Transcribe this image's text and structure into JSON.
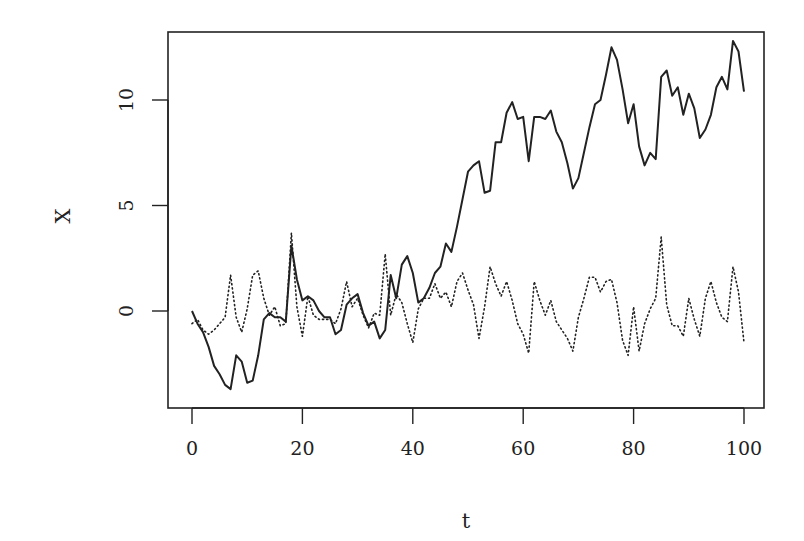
{
  "chart_data": {
    "type": "line",
    "title": "",
    "xlabel": "t",
    "ylabel": "X",
    "xlim": [
      0,
      100
    ],
    "ylim": [
      -4.5,
      13.5
    ],
    "xticks": [
      0,
      20,
      40,
      60,
      80,
      100
    ],
    "yticks": [
      0,
      5,
      10
    ],
    "grid": false,
    "legend": null,
    "series": [
      {
        "name": "random walk",
        "style": "solid",
        "x": [
          0,
          1,
          2,
          3,
          4,
          5,
          6,
          7,
          8,
          9,
          10,
          11,
          12,
          13,
          14,
          15,
          16,
          17,
          18,
          19,
          20,
          21,
          22,
          23,
          24,
          25,
          26,
          27,
          28,
          29,
          30,
          31,
          32,
          33,
          34,
          35,
          36,
          37,
          38,
          39,
          40,
          41,
          42,
          43,
          44,
          45,
          46,
          47,
          48,
          49,
          50,
          51,
          52,
          53,
          54,
          55,
          56,
          57,
          58,
          59,
          60,
          61,
          62,
          63,
          64,
          65,
          66,
          67,
          68,
          69,
          70,
          71,
          72,
          73,
          74,
          75,
          76,
          77,
          78,
          79,
          80,
          81,
          82,
          83,
          84,
          85,
          86,
          87,
          88,
          89,
          90,
          91,
          92,
          93,
          94,
          95,
          96,
          97,
          98,
          99,
          100
        ],
        "values": [
          0,
          -0.6,
          -1.0,
          -1.7,
          -2.6,
          -3.0,
          -3.5,
          -3.7,
          -2.1,
          -2.4,
          -3.4,
          -3.3,
          -2.1,
          -0.4,
          -0.1,
          -0.3,
          -0.3,
          -0.5,
          3.1,
          1.5,
          0.5,
          0.7,
          0.5,
          0.0,
          -0.3,
          -0.3,
          -1.1,
          -0.9,
          0.3,
          0.6,
          0.8,
          -0.1,
          -0.7,
          -0.5,
          -1.3,
          -0.9,
          1.7,
          0.6,
          2.2,
          2.6,
          1.8,
          0.4,
          0.6,
          1.1,
          1.8,
          2.1,
          3.2,
          2.8,
          4.0,
          5.3,
          6.6,
          6.9,
          7.1,
          5.6,
          5.7,
          8.0,
          8.0,
          9.4,
          9.9,
          9.1,
          9.2,
          7.1,
          9.2,
          9.2,
          9.1,
          9.5,
          8.5,
          8.0,
          7.0,
          5.8,
          6.3,
          7.5,
          8.7,
          9.8,
          10.0,
          11.2,
          12.5,
          11.9,
          10.5,
          8.9,
          9.8,
          7.8,
          6.9,
          7.5,
          7.2,
          11.1,
          11.4,
          10.2,
          10.6,
          9.3,
          10.3,
          9.6,
          8.2,
          8.6,
          9.3,
          10.6,
          11.1,
          10.5,
          12.8,
          12.3,
          10.4
        ]
      },
      {
        "name": "white noise",
        "style": "dotted",
        "x": [
          0,
          1,
          2,
          3,
          4,
          5,
          6,
          7,
          8,
          9,
          10,
          11,
          12,
          13,
          14,
          15,
          16,
          17,
          18,
          19,
          20,
          21,
          22,
          23,
          24,
          25,
          26,
          27,
          28,
          29,
          30,
          31,
          32,
          33,
          34,
          35,
          36,
          37,
          38,
          39,
          40,
          41,
          42,
          43,
          44,
          45,
          46,
          47,
          48,
          49,
          50,
          51,
          52,
          53,
          54,
          55,
          56,
          57,
          58,
          59,
          60,
          61,
          62,
          63,
          64,
          65,
          66,
          67,
          68,
          69,
          70,
          71,
          72,
          73,
          74,
          75,
          76,
          77,
          78,
          79,
          80,
          81,
          82,
          83,
          84,
          85,
          86,
          87,
          88,
          89,
          90,
          91,
          92,
          93,
          94,
          95,
          96,
          97,
          98,
          99,
          100
        ],
        "values": [
          -0.6,
          -0.4,
          -0.9,
          -1.1,
          -0.9,
          -0.6,
          -0.3,
          1.7,
          -0.3,
          -1.0,
          0.1,
          1.7,
          1.9,
          0.6,
          -0.2,
          0.2,
          -0.7,
          -0.6,
          3.7,
          0.2,
          -1.2,
          0.7,
          -0.2,
          -0.4,
          -0.4,
          -0.4,
          -0.6,
          0.1,
          1.4,
          0.2,
          0.6,
          -0.2,
          -0.8,
          -0.1,
          -0.2,
          2.7,
          -0.2,
          0.8,
          0.4,
          -0.6,
          -1.5,
          0.1,
          0.6,
          0.6,
          1.3,
          0.6,
          0.9,
          0.2,
          1.4,
          1.8,
          1.0,
          0.3,
          -1.3,
          0.2,
          2.1,
          1.3,
          0.7,
          1.4,
          0.5,
          -0.6,
          -1.1,
          -2.0,
          1.4,
          0.5,
          -0.2,
          0.5,
          -0.5,
          -0.9,
          -1.3,
          -1.9,
          -0.3,
          0.6,
          1.6,
          1.6,
          0.9,
          1.4,
          1.5,
          0.4,
          -1.4,
          -2.1,
          0.2,
          -1.9,
          -0.6,
          0.1,
          0.6,
          3.5,
          0.3,
          -0.7,
          -0.7,
          -1.2,
          0.6,
          -0.4,
          -1.2,
          0.6,
          1.4,
          0.4,
          -0.3,
          -0.5,
          2.1,
          0.9,
          -1.5
        ]
      }
    ]
  },
  "axes": {
    "xlabel": "t",
    "ylabel": "X",
    "xtick_labels": [
      "0",
      "20",
      "40",
      "60",
      "80",
      "100"
    ],
    "ytick_labels": [
      "0",
      "5",
      "10"
    ]
  }
}
